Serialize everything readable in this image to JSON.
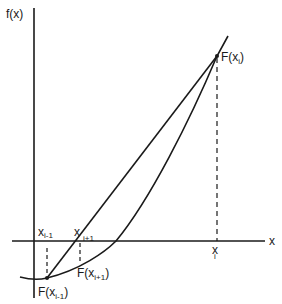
{
  "diagram": {
    "type": "secant-method-illustration",
    "axes": {
      "y_label": "f(x)",
      "x_label": "x"
    },
    "points": {
      "x_i_minus_1": {
        "label_base": "x",
        "label_sub": "i-1"
      },
      "x_i_plus_1": {
        "label_base": "x",
        "label_sub": "i+1"
      },
      "x_i": {
        "label_base": "x",
        "label_sub": "i"
      },
      "F_x_i": {
        "label_pre": "F(x",
        "label_sub": "i",
        "label_post": ")"
      },
      "F_x_i_minus_1": {
        "label_pre": "F(x",
        "label_sub": "i-1",
        "label_post": ")"
      },
      "F_x_i_plus_1": {
        "label_pre": "F(x",
        "label_sub": "i+1",
        "label_post": ")"
      }
    },
    "colors": {
      "ink": "#1a1a1a",
      "background": "#ffffff"
    }
  }
}
